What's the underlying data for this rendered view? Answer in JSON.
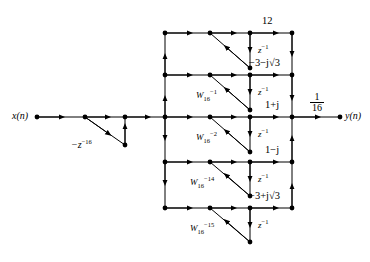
{
  "figure": {
    "input_label": "x(n)",
    "output_label": "y(n)",
    "comb_label": "−z",
    "comb_exponent": "−16",
    "output_gain_numerator": "1",
    "output_gain_denominator": "16",
    "delay_label": "z",
    "delay_exponent": "−1",
    "resonators": [
      {
        "id": "row-top",
        "numerator_label": "12",
        "coefficient_base": "",
        "coefficient_sub": "",
        "coefficient_sup": "",
        "delay_label": "z",
        "delay_exponent": "−1"
      },
      {
        "id": "row-2",
        "numerator_label": "−3−j√3",
        "coefficient_base": "W",
        "coefficient_sub": "16",
        "coefficient_sup": "−1",
        "delay_label": "z",
        "delay_exponent": "−1"
      },
      {
        "id": "row-middle",
        "numerator_label": "1+j",
        "coefficient_base": "W",
        "coefficient_sub": "16",
        "coefficient_sup": "−2",
        "delay_label": "z",
        "delay_exponent": "−1"
      },
      {
        "id": "row-4",
        "numerator_label": "1−j",
        "coefficient_base": "W",
        "coefficient_sub": "16",
        "coefficient_sup": "−14",
        "delay_label": "z",
        "delay_exponent": "−1"
      },
      {
        "id": "row-bottom",
        "numerator_label": "−3+j√3",
        "coefficient_base": "W",
        "coefficient_sub": "16",
        "coefficient_sup": "−15",
        "delay_label": "z",
        "delay_exponent": "−1"
      }
    ],
    "colors": {
      "line": "#000000",
      "node": "#000000",
      "background": "#ffffff"
    }
  }
}
